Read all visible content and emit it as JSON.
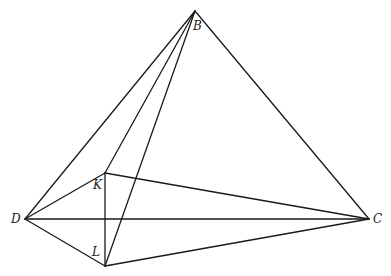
{
  "diagram": {
    "type": "geometric-figure",
    "points": {
      "B": {
        "label": "B",
        "x": 195,
        "y": 11,
        "label_x": 193,
        "label_y": 20
      },
      "D": {
        "label": "D",
        "x": 25,
        "y": 219,
        "label_x": 11,
        "label_y": 213
      },
      "C": {
        "label": "C",
        "x": 369,
        "y": 219,
        "label_x": 373,
        "label_y": 213
      },
      "K": {
        "label": "K",
        "x": 105,
        "y": 173,
        "label_x": 93,
        "label_y": 179
      },
      "L": {
        "label": "L",
        "x": 105,
        "y": 266,
        "label_x": 92,
        "label_y": 246
      }
    },
    "segments": [
      [
        "B",
        "D"
      ],
      [
        "B",
        "K"
      ],
      [
        "B",
        "L"
      ],
      [
        "B",
        "C"
      ],
      [
        "D",
        "C"
      ],
      [
        "D",
        "K"
      ],
      [
        "D",
        "L"
      ],
      [
        "K",
        "C"
      ],
      [
        "L",
        "C"
      ],
      [
        "K",
        "L"
      ]
    ],
    "line_color": "#1a1a1a"
  }
}
